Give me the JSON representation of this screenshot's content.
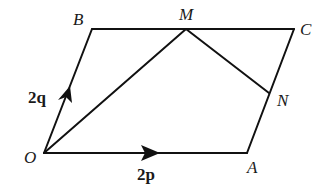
{
  "diagram": {
    "type": "parallelogram-vectors",
    "points": {
      "O": {
        "label": "O",
        "x": 44,
        "y": 153
      },
      "A": {
        "label": "A",
        "x": 247,
        "y": 153
      },
      "B": {
        "label": "B",
        "x": 92,
        "y": 29
      },
      "C": {
        "label": "C",
        "x": 294,
        "y": 29
      },
      "M": {
        "label": "M",
        "x": 186,
        "y": 29
      },
      "N": {
        "label": "N",
        "x": 269,
        "y": 93
      }
    },
    "vectors": {
      "OA": {
        "label_num": "2",
        "label_vec": "p"
      },
      "OB": {
        "label_num": "2",
        "label_vec": "q"
      }
    },
    "edges": [
      "O-A",
      "A-C",
      "C-B",
      "B-O",
      "O-M",
      "M-N"
    ],
    "line_color": "#111111"
  }
}
